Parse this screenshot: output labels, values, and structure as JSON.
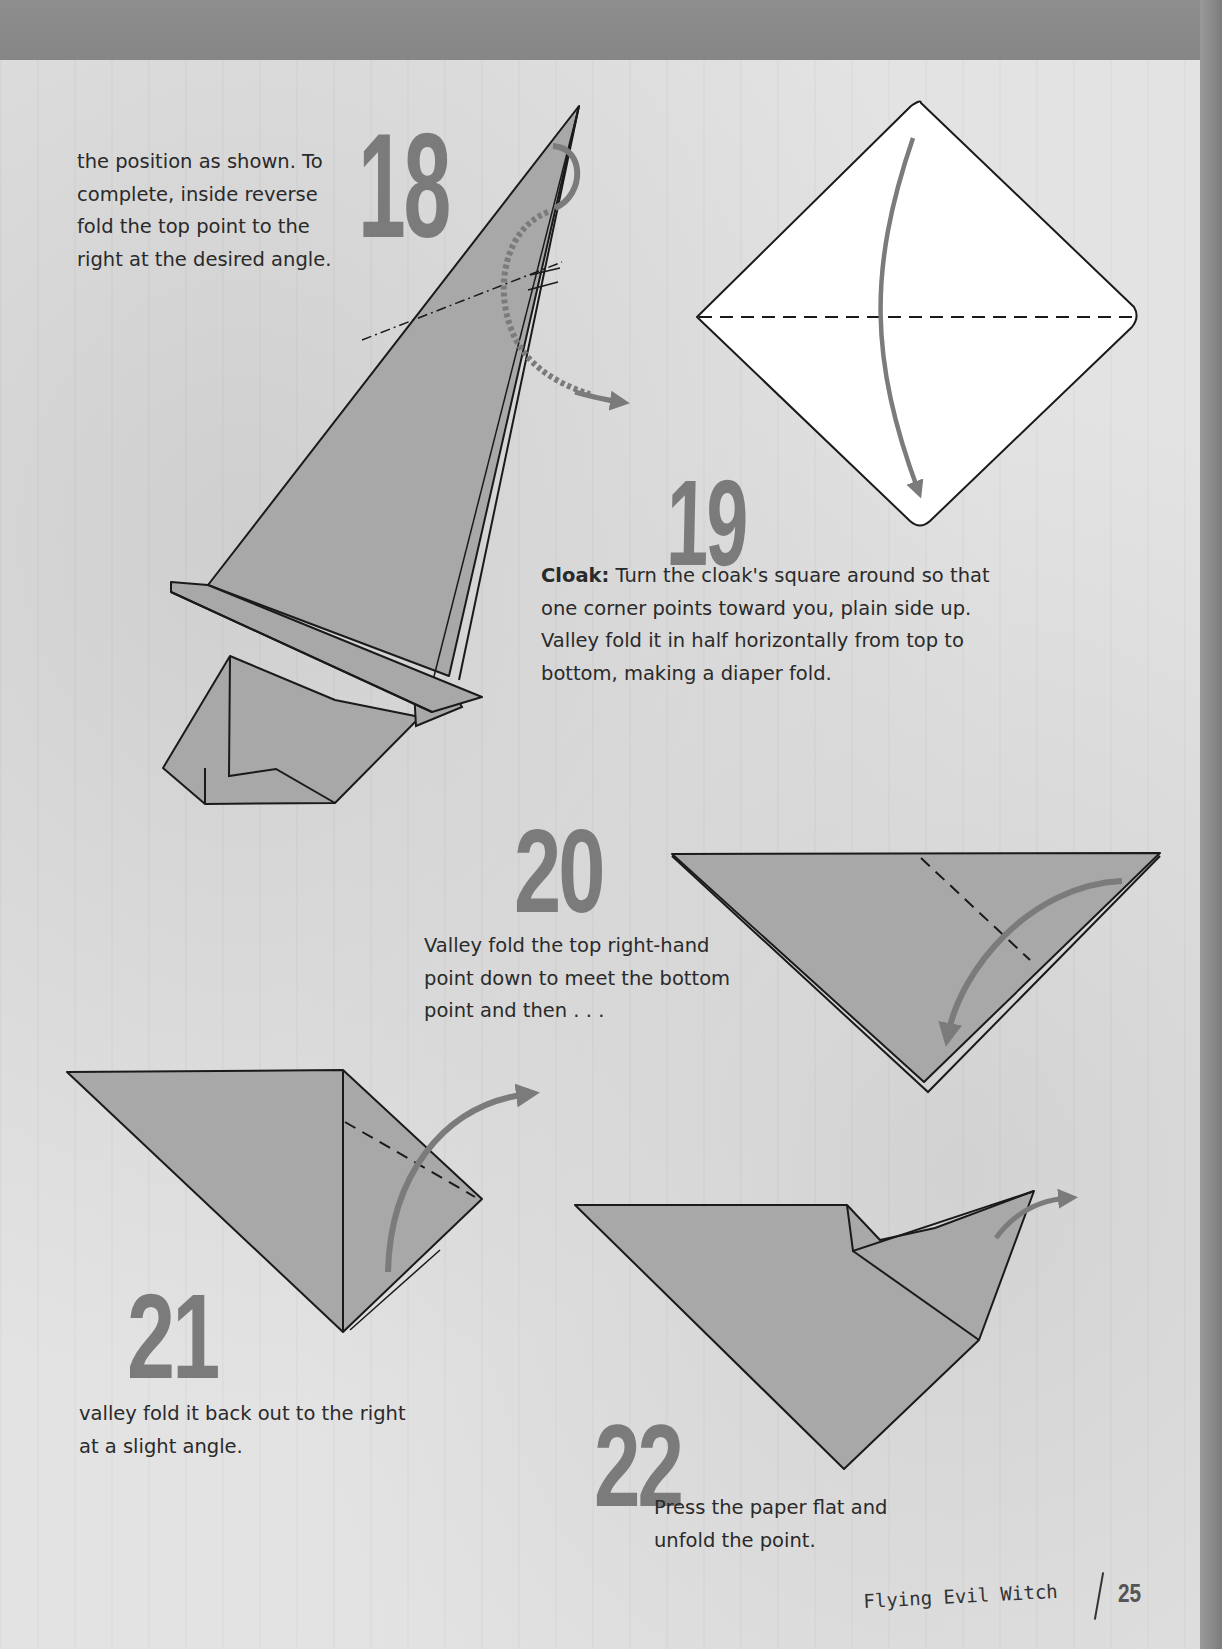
{
  "page": {
    "book_section": "Flying Evil Witch",
    "page_number": "25",
    "colors": {
      "paper_fill": "#a8a8a8",
      "outline": "#1a1a1a",
      "arrow": "#7b7b7b",
      "step_number": "#7b7b7b",
      "background": "#e3e3e3",
      "top_band": "#8a8a8a"
    }
  },
  "steps": [
    {
      "number": "18",
      "text": "the position as shown. To complete, inside reverse fold the top point to the right at the desired angle.",
      "lines": [
        "the position as shown. To",
        "complete, inside reverse",
        "fold the top point to the",
        "right at the desired angle."
      ],
      "diagram": "witch-hat-inside-reverse-fold"
    },
    {
      "number": "19",
      "lead": "Cloak:",
      "text": "Turn the cloak's square around so that one corner points toward you, plain side up. Valley fold it in half horizontally from top to bottom, making a diaper fold.",
      "lines": [
        "Turn the cloak's square around so that",
        "one corner points toward you, plain side up.",
        "Valley fold it in half horizontally from top to",
        "bottom, making a diaper fold."
      ],
      "diagram": "square-diamond-valley-fold"
    },
    {
      "number": "20",
      "text": "Valley fold the top right-hand point down to meet the bottom point and then . . .",
      "lines": [
        "Valley fold the top right-hand",
        "point down to meet the bottom",
        "point and then . . ."
      ],
      "diagram": "triangle-fold-right-corner-down"
    },
    {
      "number": "21",
      "text": "valley fold it back out to the right at a slight angle.",
      "lines": [
        "valley fold it back out to the right",
        "at a slight angle."
      ],
      "diagram": "triangle-fold-back-out"
    },
    {
      "number": "22",
      "text": "Press the paper flat and unfold the point.",
      "lines": [
        "Press the paper flat and",
        "unfold the point."
      ],
      "diagram": "triangle-unfold-point"
    }
  ]
}
